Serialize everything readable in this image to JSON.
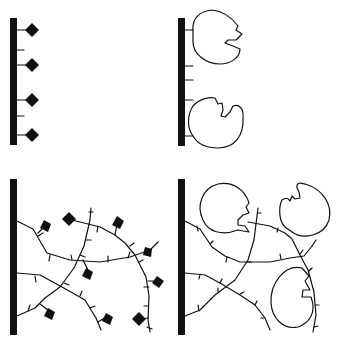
{
  "figure": {
    "panels": [
      {
        "id": "top-left",
        "label": "linear tether with small ligands",
        "surface": "black vertical bar",
        "attached": "diamond ligands",
        "count": 4
      },
      {
        "id": "top-right",
        "label": "linear tether with enzymes",
        "surface": "black vertical bar",
        "attached": "enzyme shapes",
        "count": 2
      },
      {
        "id": "bottom-left",
        "label": "branched polymer with small ligands",
        "surface": "black vertical bar",
        "attached": "diamond ligands",
        "count": 10
      },
      {
        "id": "bottom-right",
        "label": "branched polymer with enzymes",
        "surface": "black vertical bar",
        "attached": "enzyme shapes",
        "count": 3
      }
    ],
    "colors": {
      "ink": "#111111",
      "background": "#ffffff"
    }
  }
}
